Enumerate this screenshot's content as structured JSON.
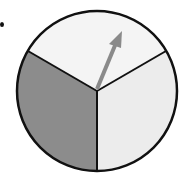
{
  "spinner": {
    "sections": [
      {
        "name": "top",
        "color": "#f4f4f4"
      },
      {
        "name": "right",
        "color": "#ececec"
      },
      {
        "name": "left",
        "color": "#8c8c8c"
      }
    ],
    "outline_color": "#111111",
    "arrow_color": "#8a8a8a",
    "section_count": 3
  }
}
